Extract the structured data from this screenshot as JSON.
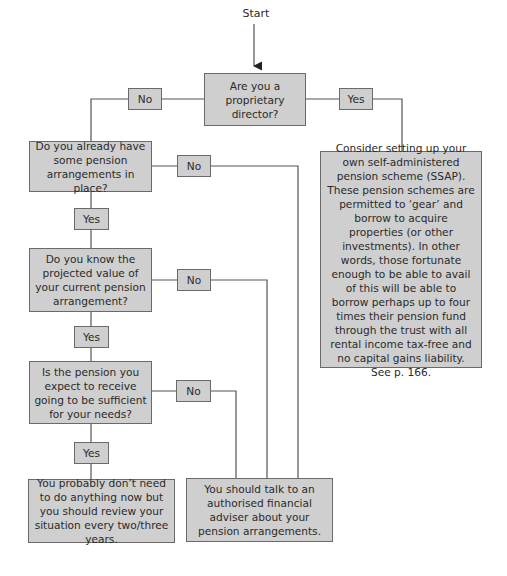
{
  "start_label": "Start",
  "nodes": {
    "q1": "Are you a proprietary director?",
    "q2": "Do you already have some pension arrangements in place?",
    "q3": "Do you know the projected value of your current pension arrangement?",
    "q4": "Is the pension you expect to receive going to be sufficient for your needs?",
    "ssap": "Consider setting up your own self-administered pension scheme (SSAP). These pension schemes are permitted to ‘gear’ and borrow to acquire properties (or other investments). In other words, those fortunate enough to be able to avail of this will be able to borrow perhaps up to four times their pension fund through the trust with all rental income tax-free and no capital gains liability. See p. 166.",
    "no_action": "You probably don’t need to do anything now but you should review your situation every two/three years.",
    "adviser": "You should talk to an authorised financial adviser about your pension arrangements."
  },
  "edge_labels": {
    "q1_no": "No",
    "q1_yes": "Yes",
    "q2_no": "No",
    "q2_yes": "Yes",
    "q3_no": "No",
    "q3_yes": "Yes",
    "q4_no": "No",
    "q4_yes": "Yes"
  },
  "colors": {
    "box_fill": "#cfcfcf",
    "box_border": "#6a6a6a",
    "line": "#555555"
  }
}
